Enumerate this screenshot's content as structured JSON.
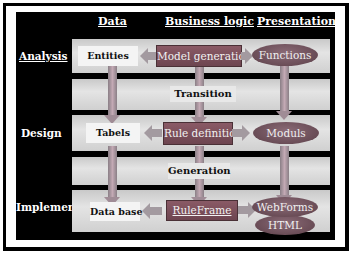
{
  "columns": {
    "data": "Data",
    "business_logic": "Business logic",
    "presentation": "Presentation"
  },
  "phases": {
    "analysis": "Analysis",
    "design": "Design",
    "implementation": "Implementation"
  },
  "transitions": {
    "analysis_to_design": "Transition",
    "design_to_implementation": "Generation"
  },
  "analysis_row": {
    "data": "Entities",
    "logic": "Model generation",
    "presentation": "Functions"
  },
  "design_row": {
    "data": "Tabels",
    "logic": "Rule definition",
    "presentation": "Moduls"
  },
  "implementation_row": {
    "data": "Data base",
    "logic": "RuleFrame",
    "presentation_top": "WebForms",
    "presentation_bottom": "HTML"
  },
  "colors": {
    "panel": "#000000",
    "band": "#d6d6d6",
    "logic_box": "#7a4f5b",
    "presentation_ellipse": "#6f5560",
    "data_box": "#f4f4f4"
  }
}
